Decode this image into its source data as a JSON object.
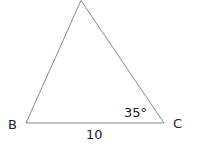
{
  "diagram": {
    "type": "triangle",
    "vertices": {
      "B": {
        "label": "B"
      },
      "C": {
        "label": "C"
      }
    },
    "angle_label": "35°",
    "side_label": "10",
    "colors": {
      "line": "#8a8a8a",
      "text": "#222222"
    }
  }
}
